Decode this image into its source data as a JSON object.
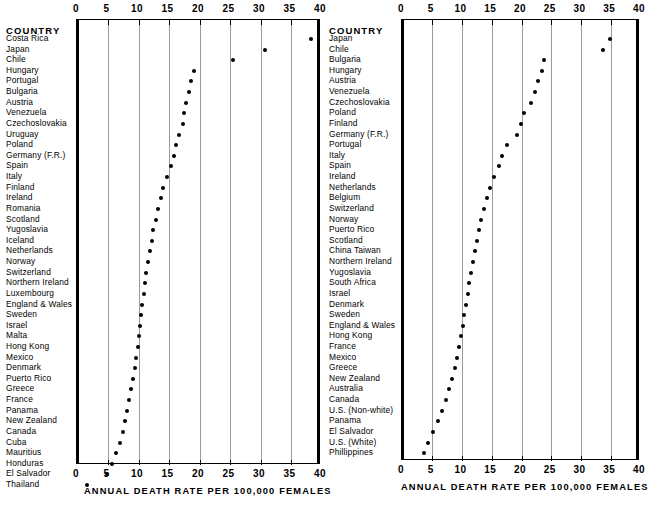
{
  "chart_data": [
    {
      "type": "scatter",
      "panel": "left",
      "title": "",
      "xlabel": "ANNUAL DEATH RATE PER 100,000 FEMALES",
      "ylabel": "COUNTRY",
      "column_header": "COUNTRY",
      "xlim": [
        0,
        40
      ],
      "xticks": [
        0,
        5,
        10,
        15,
        20,
        25,
        30,
        35,
        40
      ],
      "xtick_labels": [
        "0",
        "5",
        "10",
        "15",
        "20",
        "25",
        "30",
        "35",
        "40"
      ],
      "grid": true,
      "grid_axis": "x",
      "legend": "none",
      "categories": [
        "Costa Rica",
        "Japan",
        "Chile",
        "Hungary",
        "Portugal",
        "Bulgaria",
        "Austria",
        "Venezuela",
        "Czechoslovakia",
        "Uruguay",
        "Poland",
        "Germany  (F.R.)",
        "Spain",
        "Italy",
        "Finland",
        "Ireland",
        "Romania",
        "Scotland",
        "Yugoslavia",
        "Iceland",
        "Netherlands",
        "Norway",
        "Switzerland",
        "Northern Ireland",
        "Luxembourg",
        "England & Wales",
        "Sweden",
        "Israel",
        "Malta",
        "Hong Kong",
        "Mexico",
        "Denmark",
        "Puerto Rico",
        "Greece",
        "France",
        "Panama",
        "New Zealand",
        "Canada",
        "Cuba",
        "Mauritius",
        "Honduras",
        "El Salvador",
        "Thailand"
      ],
      "values": [
        38.0,
        30.5,
        25.3,
        18.9,
        18.3,
        18.1,
        17.5,
        17.2,
        17.1,
        16.4,
        15.9,
        15.5,
        15.0,
        14.4,
        13.8,
        13.4,
        13.0,
        12.6,
        12.2,
        11.9,
        11.6,
        11.3,
        11.0,
        10.8,
        10.6,
        10.4,
        10.2,
        10.0,
        9.8,
        9.6,
        9.4,
        9.1,
        8.8,
        8.5,
        8.2,
        7.9,
        7.6,
        7.2,
        6.7,
        6.1,
        5.4,
        4.6,
        1.3
      ]
    },
    {
      "type": "scatter",
      "panel": "right",
      "title": "",
      "xlabel": "ANNUAL DEATH RATE PER 100,000 FEMALES",
      "ylabel": "COUNTRY",
      "column_header": "COUNTRY",
      "xlim": [
        0,
        40
      ],
      "xticks": [
        0,
        5,
        10,
        15,
        20,
        25,
        30,
        35,
        40
      ],
      "xtick_labels": [
        "0",
        "5",
        "10",
        "15",
        "20",
        "25",
        "30",
        "35",
        "40"
      ],
      "grid": true,
      "grid_axis": "x",
      "legend": "none",
      "categories": [
        "Japan",
        "Chile",
        "Bulgaria",
        "Hungary",
        "Austria",
        "Venezuela",
        "Czechoslovakia",
        "Poland",
        "Finland",
        "Germany  (F.R.)",
        "Portugal",
        "Italy",
        "Spain",
        "Ireland",
        "Netherlands",
        "Belgium",
        "Switzerland",
        "Norway",
        "Puerto Rico",
        "Scotland",
        "China Taiwan",
        "Northern Ireland",
        "Yugoslavia",
        "South Africa",
        "Israel",
        "Denmark",
        "Sweden",
        "England & Wales",
        "Hong Kong",
        "France",
        "Mexico",
        "Greece",
        "New Zealand",
        "Australia",
        "Canada",
        "U.S. (Non-white)",
        "Panama",
        "El Salvador",
        "U.S. (White)",
        "Phillippines"
      ],
      "values": [
        34.6,
        33.5,
        23.6,
        23.2,
        22.6,
        22.0,
        21.3,
        20.2,
        19.6,
        19.0,
        17.3,
        16.5,
        16.0,
        15.2,
        14.4,
        13.9,
        13.4,
        13.0,
        12.6,
        12.2,
        11.9,
        11.6,
        11.3,
        11.0,
        10.7,
        10.4,
        10.1,
        9.9,
        9.6,
        9.3,
        8.9,
        8.5,
        8.0,
        7.5,
        7.0,
        6.4,
        5.7,
        4.9,
        4.0,
        3.3
      ]
    }
  ],
  "left_panel": {
    "column_header": "COUNTRY",
    "xtitle": "ANNUAL DEATH RATE PER 100,000 FEMALES",
    "tick_labels": [
      "0",
      "5",
      "10",
      "15",
      "20",
      "25",
      "30",
      "35",
      "40"
    ]
  },
  "right_panel": {
    "column_header": "COUNTRY",
    "xtitle": "ANNUAL DEATH RATE PER 100,000 FEMALES",
    "tick_labels": [
      "0",
      "5",
      "10",
      "15",
      "20",
      "25",
      "30",
      "35",
      "40"
    ]
  }
}
